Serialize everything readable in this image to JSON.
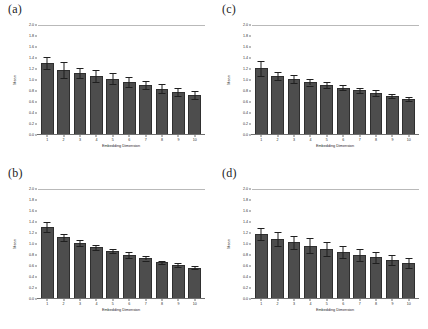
{
  "figure": {
    "background": "#ffffff",
    "bar_color": "#4d4d4d",
    "bar_edge_color": "#2f2f2f",
    "error_color": "#1f1f1f",
    "gridline_color": "#b9b9b9"
  },
  "panels": [
    {
      "label": "(a)"
    },
    {
      "label": "(c)"
    },
    {
      "label": "(b)"
    },
    {
      "label": "(d)"
    }
  ],
  "chart_data": [
    {
      "type": "bar",
      "panel": "(a)",
      "title": "(a)",
      "xlabel": "Embedding Dimension",
      "ylabel": "Mean",
      "categories": [
        "1",
        "2",
        "3",
        "4",
        "5",
        "6",
        "7",
        "8",
        "9",
        "10"
      ],
      "values": [
        1.31,
        1.18,
        1.13,
        1.08,
        1.02,
        0.97,
        0.91,
        0.84,
        0.78,
        0.73
      ],
      "errors": [
        0.11,
        0.14,
        0.09,
        0.11,
        0.1,
        0.09,
        0.08,
        0.08,
        0.07,
        0.07
      ],
      "ylim": [
        0.0,
        2.0
      ],
      "yticks": [
        "2.0",
        "1.8",
        "1.6",
        "1.4",
        "1.2",
        "1.0",
        "0.8",
        "0.6",
        "0.4",
        "0.2",
        "0.0"
      ],
      "grid": false,
      "legend": "none"
    },
    {
      "type": "bar",
      "panel": "(c)",
      "title": "(c)",
      "xlabel": "Embedding Dimension",
      "ylabel": "Mean",
      "categories": [
        "1",
        "2",
        "3",
        "4",
        "5",
        "6",
        "7",
        "8",
        "9",
        "10"
      ],
      "values": [
        1.21,
        1.07,
        1.02,
        0.96,
        0.91,
        0.86,
        0.81,
        0.76,
        0.71,
        0.65
      ],
      "errors": [
        0.13,
        0.07,
        0.07,
        0.06,
        0.06,
        0.05,
        0.05,
        0.05,
        0.04,
        0.04
      ],
      "ylim": [
        0.0,
        2.0
      ],
      "yticks": [
        "2.0",
        "1.8",
        "1.6",
        "1.4",
        "1.2",
        "1.0",
        "0.8",
        "0.6",
        "0.4",
        "0.2",
        "0.0"
      ],
      "grid": false,
      "legend": "none"
    },
    {
      "type": "bar",
      "panel": "(b)",
      "title": "(b)",
      "xlabel": "Embedding Dimension",
      "ylabel": "Mean",
      "categories": [
        "1",
        "2",
        "3",
        "4",
        "5",
        "6",
        "7",
        "8",
        "9",
        "10"
      ],
      "values": [
        1.31,
        1.12,
        1.02,
        0.94,
        0.87,
        0.8,
        0.74,
        0.67,
        0.62,
        0.57
      ],
      "errors": [
        0.09,
        0.06,
        0.06,
        0.05,
        0.04,
        0.05,
        0.04,
        0.03,
        0.03,
        0.03
      ],
      "ylim": [
        0.0,
        2.0
      ],
      "yticks": [
        "2.0",
        "1.8",
        "1.6",
        "1.4",
        "1.2",
        "1.0",
        "0.8",
        "0.6",
        "0.4",
        "0.2",
        "0.0"
      ],
      "grid": false,
      "legend": "none"
    },
    {
      "type": "bar",
      "panel": "(d)",
      "title": "(d)",
      "xlabel": "Embedding Dimension",
      "ylabel": "Mean",
      "categories": [
        "1",
        "2",
        "3",
        "4",
        "5",
        "6",
        "7",
        "8",
        "9",
        "10"
      ],
      "values": [
        1.19,
        1.09,
        1.03,
        0.97,
        0.91,
        0.85,
        0.8,
        0.76,
        0.71,
        0.66
      ],
      "errors": [
        0.11,
        0.13,
        0.12,
        0.14,
        0.13,
        0.11,
        0.11,
        0.1,
        0.09,
        0.09
      ],
      "ylim": [
        0.0,
        2.0
      ],
      "yticks": [
        "2.0",
        "1.8",
        "1.6",
        "1.4",
        "1.2",
        "1.0",
        "0.8",
        "0.6",
        "0.4",
        "0.2",
        "0.0"
      ],
      "grid": false,
      "legend": "none"
    }
  ]
}
